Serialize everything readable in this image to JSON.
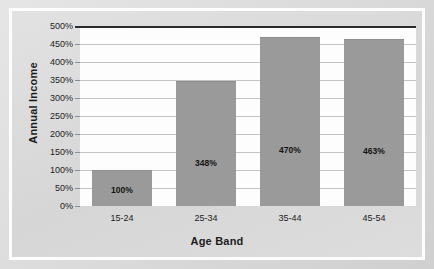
{
  "chart_data": {
    "type": "bar",
    "title": "",
    "xlabel": "Age Band",
    "ylabel": "Annual Income",
    "categories": [
      "15-24",
      "25-34",
      "35-44",
      "45-54"
    ],
    "values": [
      100,
      348,
      470,
      463
    ],
    "data_labels": [
      "100%",
      "348%",
      "470%",
      "463%"
    ],
    "ylim": [
      0,
      500
    ],
    "ytick_step": 50,
    "ytick_labels": [
      "0%",
      "50%",
      "100%",
      "150%",
      "200%",
      "250%",
      "300%",
      "350%",
      "400%",
      "450%",
      "500%"
    ],
    "ytick_values": [
      0,
      50,
      100,
      150,
      200,
      250,
      300,
      350,
      400,
      450,
      500
    ],
    "grid": true,
    "legend": false,
    "series": [
      {
        "name": "Annual Income",
        "values": [
          100,
          348,
          470,
          463
        ]
      }
    ],
    "colors": {
      "bar_fill": "#9a9a9a",
      "plot_background": "#fdfdfd",
      "chart_background": "#dcdcdc",
      "gridline": "#c4c4c4",
      "axis_line": "#2b2b2b",
      "text": "#1d1d1d"
    }
  }
}
